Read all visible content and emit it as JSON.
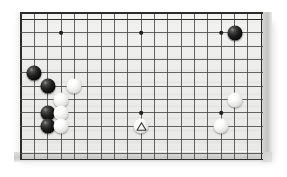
{
  "app": {
    "title": "Go board position",
    "board_type": "go-goban",
    "description": "19x19 Go board, partial view"
  },
  "board": {
    "columns_visible": 19,
    "rows_visible": 11,
    "cell_size": 13.35,
    "origin_x": 21,
    "origin_y": 19.5,
    "line_color": "#4a4a4a",
    "border_color": "#2b2b2b",
    "surface_color": "#eeeeec",
    "edge_color": "#d2d2d0",
    "shadow_color": "#c9c9c9"
  },
  "star_points": [
    {
      "name": "star-point-top-left",
      "col": 3,
      "row": 1
    },
    {
      "name": "star-point-top-center",
      "col": 9,
      "row": 1
    },
    {
      "name": "star-point-top-right",
      "col": 15,
      "row": 1
    },
    {
      "name": "star-point-mid-center",
      "col": 9,
      "row": 7
    },
    {
      "name": "star-point-mid-right",
      "col": 15,
      "row": 7
    }
  ],
  "stones": [
    {
      "id": "b1",
      "color": "black",
      "col": 16,
      "row": 1,
      "mark": "none",
      "label": "black-stone-top-right"
    },
    {
      "id": "b2",
      "color": "black",
      "col": 1,
      "row": 4,
      "mark": "none",
      "label": "black-stone-left-upper"
    },
    {
      "id": "b3",
      "color": "black",
      "col": 2,
      "row": 5,
      "mark": "none",
      "label": "black-stone-left-a"
    },
    {
      "id": "b4",
      "color": "black",
      "col": 2,
      "row": 7,
      "mark": "none",
      "label": "black-stone-left-b"
    },
    {
      "id": "b5",
      "color": "black",
      "col": 2,
      "row": 8,
      "mark": "none",
      "label": "black-stone-left-c"
    },
    {
      "id": "w1",
      "color": "white",
      "col": 4,
      "row": 5,
      "mark": "none",
      "label": "white-stone-left-a"
    },
    {
      "id": "w2",
      "color": "white",
      "col": 3,
      "row": 6,
      "mark": "none",
      "label": "white-stone-left-b"
    },
    {
      "id": "w3",
      "color": "white",
      "col": 3,
      "row": 7,
      "mark": "none",
      "label": "white-stone-left-c"
    },
    {
      "id": "w4",
      "color": "white",
      "col": 3,
      "row": 8,
      "mark": "none",
      "label": "white-stone-left-d"
    },
    {
      "id": "w5",
      "color": "white",
      "col": 9,
      "row": 8,
      "mark": "triangle",
      "label": "white-stone-marked-center"
    },
    {
      "id": "w6",
      "color": "white",
      "col": 16,
      "row": 6,
      "mark": "none",
      "label": "white-stone-right-upper"
    },
    {
      "id": "w7",
      "color": "white",
      "col": 15,
      "row": 8,
      "mark": "none",
      "label": "white-stone-right-lower"
    }
  ],
  "marks": {
    "triangle": {
      "name": "triangle-mark",
      "stroke": "#333333",
      "fill": "none",
      "on_stone": "w5"
    }
  },
  "counts": {
    "black_stones": 5,
    "white_stones": 7,
    "marked_stones": 1
  }
}
